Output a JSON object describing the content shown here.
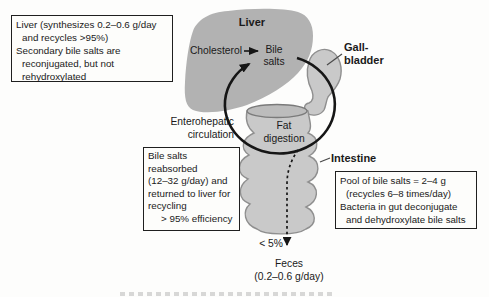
{
  "labels": {
    "liver": "Liver",
    "cholesterol": "Cholesterol",
    "bile_line1": "Bile",
    "bile_line2": "salts",
    "gallbladder_line1": "Gall-",
    "gallbladder_line2": "bladder",
    "entero_line1": "Enterohepatic",
    "entero_line2": "circulation",
    "fat_line1": "Fat",
    "fat_line2": "digestion",
    "intestine": "Intestine",
    "percent_to_feces": "< 5%",
    "feces_line1": "Feces",
    "feces_line2": "(0.2–0.6 g/day)"
  },
  "boxes": {
    "liver_note": {
      "lines": [
        "Liver (synthesizes 0.2–0.6 g/day",
        "and recycles >95%)",
        "Secondary bile salts are",
        "reconjugated, but not",
        "rehydroxylated"
      ]
    },
    "reabsorb_note": {
      "lines": [
        "Bile salts",
        "reabsorbed",
        "(12–32 g/day) and",
        "returned to liver for",
        "recycling",
        "> 95% efficiency"
      ]
    },
    "pool_note": {
      "lines": [
        "Pool of bile salts = 2–4 g",
        "(recycles 6–8 times/day)",
        "Bacteria in gut deconjugate",
        "and dehydroxylate bile salts"
      ]
    }
  },
  "icons": {
    "circulation_loop": "clockwise-loop-arrow",
    "cholesterol_to_bile": "right-arrow",
    "feces_path": "dashed-down-arrow"
  },
  "colors": {
    "ink": "#1a1a1a",
    "liver_fill": "#b2b2b2",
    "organ_fill": "#c9c9c9",
    "organ_stroke": "#8f8f8f",
    "cup_fill": "#bcbcbc",
    "cup_stroke": "#7a7a7a",
    "arrow": "#161616",
    "pointer": "#4a4a4a",
    "box_border": "#1f1f1f",
    "box_bg": "#fdfdfb"
  }
}
